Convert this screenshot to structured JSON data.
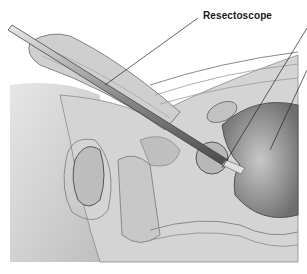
{
  "figure": {
    "labels": [
      {
        "text": "Resectoscope"
      }
    ],
    "colors": {
      "background": "#ffffff",
      "tissue_light": "#d9d9d9",
      "tissue_mid": "#b5b5b5",
      "tissue_dark": "#7a7a7a",
      "instrument": "#9a9a9a",
      "line": "#333333"
    }
  }
}
